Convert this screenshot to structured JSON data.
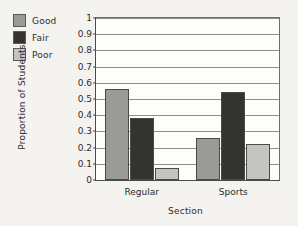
{
  "chart_data": {
    "type": "bar",
    "title": "",
    "xlabel": "Section",
    "ylabel": "Proportion of Students",
    "categories": [
      "Regular",
      "Sports"
    ],
    "series": [
      {
        "name": "Good",
        "color": "#9a9a98",
        "values": [
          0.56,
          0.26
        ]
      },
      {
        "name": "Fair",
        "color": "#333330",
        "values": [
          0.38,
          0.545
        ]
      },
      {
        "name": "Poor",
        "color": "#c4c4c2",
        "values": [
          0.075,
          0.225
        ]
      }
    ],
    "ylim": [
      0,
      1
    ],
    "yticks": [
      "0",
      "0.1",
      "0.2",
      "0.3",
      "0.4",
      "0.5",
      "0.6",
      "0.7",
      "0.8",
      "0.9",
      "1"
    ],
    "ytick_values": [
      0,
      0.1,
      0.2,
      0.3,
      0.4,
      0.5,
      0.6,
      0.7,
      0.8,
      0.9,
      1
    ],
    "grid": "horizontal",
    "legend_position": "outside-top-left"
  },
  "legend": {
    "items": [
      {
        "label": "Good",
        "color": "#9a9a98"
      },
      {
        "label": "Fair",
        "color": "#333330"
      },
      {
        "label": "Poor",
        "color": "#c4c4c2"
      }
    ]
  },
  "axes": {
    "y_title": "Proportion of Students",
    "x_title": "Section"
  }
}
